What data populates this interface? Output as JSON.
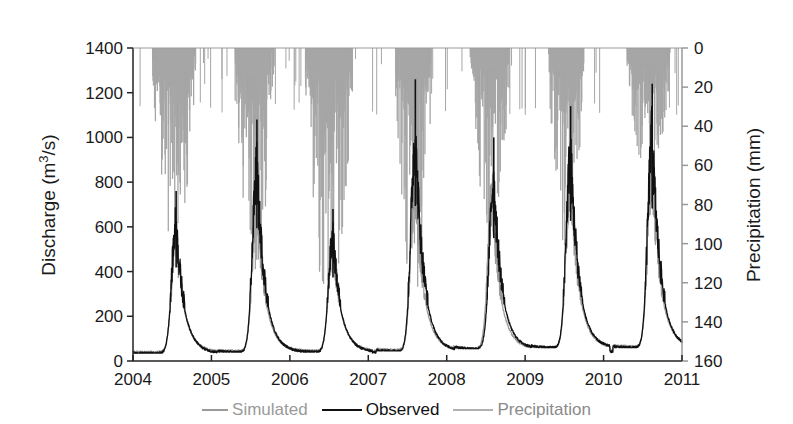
{
  "chart_data": {
    "type": "line",
    "title": "",
    "xlabel": "",
    "ylabel": "Discharge (m3/s)",
    "ylabel_parts": {
      "base": "Discharge (m",
      "sup": "3",
      "tail": "/s)"
    },
    "y2label": "Precipitation (mm)",
    "x_ticks": [
      "2004",
      "2005",
      "2006",
      "2007",
      "2008",
      "2009",
      "2010",
      "2011"
    ],
    "xlim": [
      2004,
      2011
    ],
    "ylim": [
      0,
      1400
    ],
    "y_ticks": [
      0,
      200,
      400,
      600,
      800,
      1000,
      1200,
      1400
    ],
    "y2lim": [
      0,
      160
    ],
    "y2_inverted": true,
    "y2_ticks": [
      0,
      20,
      40,
      60,
      80,
      100,
      120,
      140,
      160
    ],
    "grid": false,
    "legend_position": "bottom",
    "colors": {
      "simulated": "#9a9a9a",
      "observed": "#111111",
      "precipitation": "#a6a6a6"
    },
    "series": [
      {
        "name": "Simulated",
        "type": "line",
        "axis": "left",
        "annual_peaks": [
          {
            "year": 2004,
            "peak_time": 2004.55,
            "peak": 700,
            "baseflow": 40
          },
          {
            "year": 2005,
            "peak_time": 2005.58,
            "peak": 900,
            "baseflow": 45
          },
          {
            "year": 2006,
            "peak_time": 2006.55,
            "peak": 650,
            "baseflow": 45
          },
          {
            "year": 2007,
            "peak_time": 2007.6,
            "peak": 1000,
            "baseflow": 50
          },
          {
            "year": 2008,
            "peak_time": 2008.58,
            "peak": 900,
            "baseflow": 55
          },
          {
            "year": 2009,
            "peak_time": 2009.58,
            "peak": 1000,
            "baseflow": 60
          },
          {
            "year": 2010,
            "peak_time": 2010.62,
            "peak": 1050,
            "baseflow": 65
          }
        ]
      },
      {
        "name": "Observed",
        "type": "line",
        "axis": "left",
        "annual_peaks": [
          {
            "year": 2004,
            "peak_time": 2004.55,
            "peak": 760,
            "baseflow": 35
          },
          {
            "year": 2005,
            "peak_time": 2005.58,
            "peak": 1080,
            "baseflow": 40
          },
          {
            "year": 2006,
            "peak_time": 2006.55,
            "peak": 680,
            "baseflow": 40
          },
          {
            "year": 2007,
            "peak_time": 2007.6,
            "peak": 1260,
            "baseflow": 45
          },
          {
            "year": 2008,
            "peak_time": 2008.6,
            "peak": 1000,
            "baseflow": 55
          },
          {
            "year": 2009,
            "peak_time": 2009.58,
            "peak": 1140,
            "baseflow": 60
          },
          {
            "year": 2010,
            "peak_time": 2010.62,
            "peak": 1240,
            "baseflow": 60
          }
        ]
      },
      {
        "name": "Precipitation",
        "type": "bar",
        "axis": "right",
        "wet_seasons": [
          {
            "start": 2004.25,
            "end": 2004.8,
            "max_mm": 105
          },
          {
            "start": 2005.3,
            "end": 2005.8,
            "max_mm": 115
          },
          {
            "start": 2006.2,
            "end": 2006.8,
            "max_mm": 135
          },
          {
            "start": 2007.35,
            "end": 2007.8,
            "max_mm": 130
          },
          {
            "start": 2008.3,
            "end": 2008.8,
            "max_mm": 95
          },
          {
            "start": 2009.3,
            "end": 2009.75,
            "max_mm": 105
          },
          {
            "start": 2010.3,
            "end": 2010.85,
            "max_mm": 70
          }
        ]
      }
    ]
  },
  "legend": {
    "items": [
      {
        "label": "Simulated"
      },
      {
        "label": "Observed"
      },
      {
        "label": "Precipitation"
      }
    ]
  }
}
